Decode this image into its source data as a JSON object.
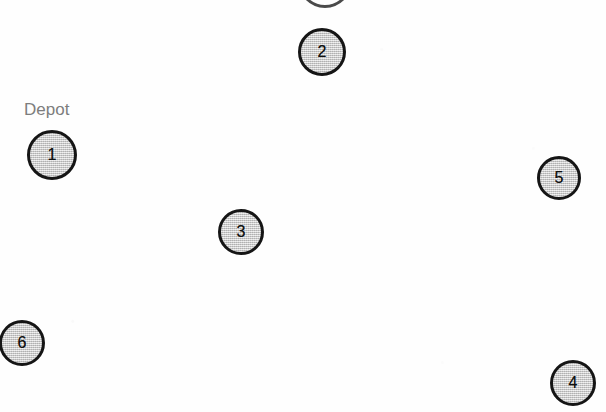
{
  "diagram": {
    "background_color": "#fefefe",
    "width": 606,
    "height": 412,
    "node_fill_color": "#cdcdcd",
    "node_border_color": "#151515",
    "label_color": "#7d7d7d",
    "number_color": "#101010"
  },
  "labels": [
    {
      "id": "depot-label",
      "text": "Depot",
      "x": 24,
      "y": 101,
      "color": "#7d7d7d"
    }
  ],
  "nodes": [
    {
      "id": "node-1",
      "number": "1",
      "label": "Depot",
      "cx": 52,
      "cy": 155,
      "r": 25
    },
    {
      "id": "node-2",
      "number": "2",
      "label": "",
      "cx": 322,
      "cy": 52,
      "r": 24
    },
    {
      "id": "node-3",
      "number": "3",
      "label": "",
      "cx": 241,
      "cy": 232,
      "r": 23
    },
    {
      "id": "node-4",
      "number": "4",
      "label": "",
      "cx": 573,
      "cy": 383,
      "r": 23
    },
    {
      "id": "node-5",
      "number": "5",
      "label": "",
      "cx": 559,
      "cy": 178,
      "r": 22
    },
    {
      "id": "node-6",
      "number": "6",
      "label": "",
      "cx": 22,
      "cy": 343,
      "r": 23
    }
  ],
  "artifacts": [
    {
      "id": "top-clipped-shape",
      "cx": 322,
      "cy": -22,
      "r": 24
    }
  ],
  "chart_data": {
    "type": "scatter",
    "xlabel": "",
    "ylabel": "",
    "xlim": [
      0,
      606
    ],
    "ylim": [
      0,
      412
    ],
    "grid": false,
    "legend": "none",
    "categories": [
      "1",
      "2",
      "3",
      "4",
      "5",
      "6"
    ],
    "points": [
      {
        "label": "1",
        "x": 52,
        "y": 155,
        "annotation": "Depot"
      },
      {
        "label": "2",
        "x": 322,
        "y": 52,
        "annotation": ""
      },
      {
        "label": "3",
        "x": 241,
        "y": 232,
        "annotation": ""
      },
      {
        "label": "4",
        "x": 573,
        "y": 383,
        "annotation": ""
      },
      {
        "label": "5",
        "x": 559,
        "y": 178,
        "annotation": ""
      },
      {
        "label": "6",
        "x": 22,
        "y": 343,
        "annotation": ""
      }
    ],
    "annotations": [
      "Depot"
    ]
  }
}
